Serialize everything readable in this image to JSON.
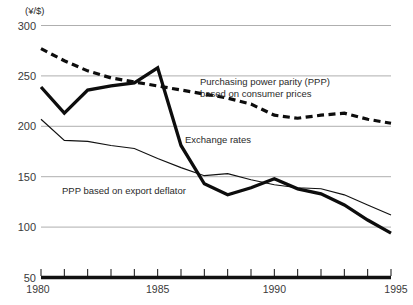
{
  "chart_data": {
    "type": "line",
    "title": "",
    "xlabel": "",
    "ylabel": "(¥/$)",
    "y_unit_label": "(¥/$)",
    "xlim": [
      1980,
      1995
    ],
    "ylim": [
      50,
      300
    ],
    "y_ticks": [
      300,
      250,
      200,
      150,
      100,
      50
    ],
    "y_tick_labels": [
      "300",
      "250",
      "200",
      "150",
      "100",
      "50"
    ],
    "x_ticks": [
      1980,
      1981,
      1982,
      1983,
      1984,
      1985,
      1986,
      1987,
      1988,
      1989,
      1990,
      1991,
      1992,
      1993,
      1994,
      1995
    ],
    "x_tick_labels_shown": [
      {
        "value": 1980,
        "label": "1980"
      },
      {
        "value": 1985,
        "label": "1985"
      },
      {
        "value": 1990,
        "label": "1990"
      },
      {
        "value": 1995,
        "label": "1995"
      }
    ],
    "grid": true,
    "grid_axis": "y",
    "legend": "inline-annotations",
    "x": [
      1980,
      1981,
      1982,
      1983,
      1984,
      1985,
      1986,
      1987,
      1988,
      1989,
      1990,
      1991,
      1992,
      1993,
      1994,
      1995
    ],
    "series": [
      {
        "name": "Exchange rates",
        "style": "solid-thick",
        "color": "#0d0d0d",
        "values": [
          239,
          213,
          236,
          240,
          243,
          258,
          181,
          143,
          132,
          139,
          148,
          138,
          133,
          122,
          107,
          94
        ]
      },
      {
        "name": "Purchasing power parity (PPP) based on consumer prices",
        "style": "dashed-thick",
        "color": "#0d0d0d",
        "values": [
          277,
          265,
          255,
          248,
          244,
          240,
          236,
          232,
          228,
          222,
          211,
          208,
          211,
          213,
          207,
          203
        ]
      },
      {
        "name": "PPP based on export deflator",
        "style": "solid-thin",
        "color": "#111111",
        "values": [
          207,
          186,
          185,
          181,
          178,
          168,
          159,
          151,
          153,
          147,
          142,
          139,
          138,
          132,
          122,
          112
        ]
      }
    ],
    "annotations": [
      {
        "id": "ppp-cpi-label",
        "lines": [
          "Purchasing power parity (PPP)",
          "based  on consumer prices"
        ],
        "x_px": 200,
        "y_px": 85
      },
      {
        "id": "exchange-rates-label",
        "lines": [
          "Exchange rates"
        ],
        "x_px": 185,
        "y_px": 143
      },
      {
        "id": "ppp-export-label",
        "lines": [
          "PPP based on export deflator"
        ],
        "x_px": 62,
        "y_px": 194
      }
    ]
  },
  "colors": {
    "background": "#ffffff",
    "gridline": "#9a9a9a",
    "axis": "#111111",
    "text": "#2a2a2a",
    "series_primary": "#0d0d0d"
  }
}
